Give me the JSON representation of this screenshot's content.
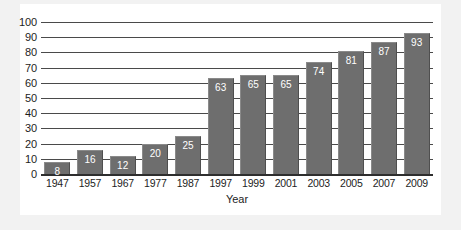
{
  "chart_data": {
    "type": "bar",
    "title": "",
    "subtitle": "",
    "xlabel": "Year",
    "ylabel": "",
    "categories": [
      "1947",
      "1957",
      "1967",
      "1977",
      "1987",
      "1997",
      "1999",
      "2001",
      "2003",
      "2005",
      "2007",
      "2009"
    ],
    "values": [
      8,
      16,
      12,
      20,
      25,
      63,
      65,
      65,
      74,
      81,
      87,
      93
    ],
    "data_labels": [
      "8",
      "16",
      "12",
      "20",
      "25",
      "63",
      "65",
      "65",
      "74",
      "81",
      "87",
      "93"
    ],
    "ylim": [
      0,
      100
    ],
    "ytick_labels": [
      "100",
      "90",
      "80",
      "70",
      "60",
      "50",
      "40",
      "30",
      "20",
      "10",
      "0"
    ],
    "ytick_values": [
      100,
      90,
      80,
      70,
      60,
      50,
      40,
      30,
      20,
      10,
      0
    ],
    "ytick_step": 10,
    "grid": true,
    "grid_axis": "y",
    "legend": false,
    "legend_position": "none",
    "series": [
      {
        "name": "",
        "values": [
          8,
          16,
          12,
          20,
          25,
          63,
          65,
          65,
          74,
          81,
          87,
          93
        ]
      }
    ]
  },
  "colors": {
    "bar_fill": "#6e6e6e",
    "bar_value_text": "#ffffff",
    "gridline": "#4a4a4a",
    "baseline": "#2e2e2e",
    "axis_text": "#1d1d1d",
    "plot_background": "#ffffff",
    "figure_background": "#f2f2f2"
  }
}
